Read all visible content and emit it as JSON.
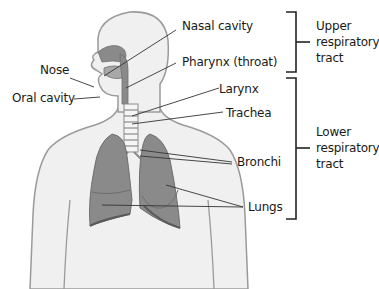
{
  "diagram": {
    "labels": {
      "nasal_cavity": "Nasal cavity",
      "pharynx": "Pharynx (throat)",
      "nose": "Nose",
      "oral_cavity": "Oral cavity",
      "larynx": "Larynx",
      "trachea": "Trachea",
      "bronchi": "Bronchi",
      "lungs": "Lungs"
    },
    "groups": {
      "upper": [
        "Upper",
        "respiratory",
        "tract"
      ],
      "lower": [
        "Lower",
        "respiratory",
        "tract"
      ]
    },
    "colors": {
      "body_fill": "#f0f0f0",
      "body_outline": "#9a9a9a",
      "organ_fill": "#8a8a8a",
      "organ_dark": "#6e6e6e",
      "line": "#333333"
    }
  }
}
